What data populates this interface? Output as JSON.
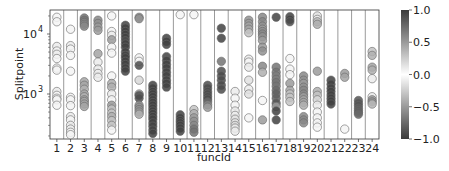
{
  "chart_data": {
    "type": "scatter",
    "title": "",
    "xlabel": "funcId",
    "ylabel": "Splitpoint",
    "yscale": "log",
    "ylim": [
      178,
      25000
    ],
    "y_ticks": [
      {
        "value": 1000,
        "label": "10^3",
        "base": "10",
        "exp": "3"
      },
      {
        "value": 10000,
        "label": "10^4",
        "base": "10",
        "exp": "4"
      }
    ],
    "categories": [
      "1",
      "2",
      "3",
      "4",
      "5",
      "6",
      "7",
      "8",
      "9",
      "10",
      "11",
      "12",
      "13",
      "14",
      "15",
      "16",
      "17",
      "18",
      "19",
      "20",
      "21",
      "22",
      "23",
      "24"
    ],
    "grid": "vertical separators between categories",
    "colorbar": {
      "min": -1.0,
      "max": 1.0,
      "ticks": [
        "1.0",
        "0.5",
        "0.0",
        "−0.5",
        "−1.0"
      ],
      "tick_values": [
        1.0,
        0.5,
        0.0,
        -0.5,
        -1.0
      ],
      "colormap": "diverging gray (dark at ±1, white at 0)"
    },
    "series": [
      {
        "funcId": "1",
        "points": [
          [
            19000,
            0.05
          ],
          [
            16000,
            0.05
          ],
          [
            6200,
            0.1
          ],
          [
            5200,
            0.05
          ],
          [
            4600,
            0.1
          ],
          [
            3900,
            0.05
          ],
          [
            2700,
            0.05
          ],
          [
            2500,
            0.05
          ],
          [
            1100,
            0.1
          ],
          [
            950,
            0.05
          ],
          [
            850,
            0.05
          ],
          [
            800,
            0.05
          ],
          [
            650,
            0.05
          ]
        ]
      },
      {
        "funcId": "2",
        "points": [
          [
            12000,
            0.05
          ],
          [
            6400,
            0.1
          ],
          [
            5600,
            0.05
          ],
          [
            4400,
            0.05
          ],
          [
            2400,
            0.05
          ],
          [
            880,
            0.05
          ],
          [
            800,
            0.05
          ],
          [
            640,
            0.05
          ],
          [
            420,
            0.1
          ],
          [
            370,
            0.05
          ],
          [
            300,
            0.1
          ],
          [
            260,
            0.1
          ],
          [
            230,
            0.05
          ],
          [
            210,
            0.05
          ]
        ]
      },
      {
        "funcId": "3",
        "points": [
          [
            18500,
            0.7
          ],
          [
            17000,
            0.7
          ],
          [
            15500,
            0.6
          ],
          [
            14500,
            0.6
          ],
          [
            13500,
            0.6
          ],
          [
            1600,
            0.45
          ],
          [
            1400,
            0.45
          ],
          [
            1200,
            0.4
          ],
          [
            1000,
            0.45
          ],
          [
            900,
            0.4
          ],
          [
            800,
            0.45
          ],
          [
            750,
            0.45
          ],
          [
            680,
            0.45
          ],
          [
            620,
            0.45
          ]
        ]
      },
      {
        "funcId": "4",
        "points": [
          [
            17000,
            0.6
          ],
          [
            15000,
            0.55
          ],
          [
            13000,
            0.5
          ],
          [
            11500,
            0.5
          ],
          [
            4700,
            0.45
          ],
          [
            3400,
            0.1
          ],
          [
            2600,
            0.1
          ],
          [
            2200,
            0.1
          ],
          [
            1900,
            0.1
          ]
        ]
      },
      {
        "funcId": "5",
        "points": [
          [
            20000,
            0.05
          ],
          [
            11000,
            0.05
          ],
          [
            9500,
            0.1
          ],
          [
            8000,
            0.5
          ],
          [
            6000,
            0.05
          ],
          [
            4800,
            0.05
          ],
          [
            2000,
            0.05
          ],
          [
            1500,
            0.4
          ],
          [
            1300,
            0.4
          ],
          [
            1000,
            0.1
          ],
          [
            800,
            0.05
          ],
          [
            650,
            0.5
          ],
          [
            560,
            0.3
          ],
          [
            480,
            0.3
          ],
          [
            420,
            0.4
          ],
          [
            360,
            0.3
          ],
          [
            300,
            0.3
          ],
          [
            250,
            0.05
          ]
        ]
      },
      {
        "funcId": "6",
        "points": [
          [
            14000,
            0.95
          ],
          [
            12500,
            0.95
          ],
          [
            11000,
            0.95
          ],
          [
            9800,
            0.95
          ],
          [
            8700,
            0.95
          ],
          [
            7700,
            0.9
          ],
          [
            6800,
            0.95
          ],
          [
            6000,
            0.95
          ],
          [
            5000,
            0.95
          ],
          [
            4400,
            0.95
          ],
          [
            4000,
            0.95
          ],
          [
            3500,
            0.95
          ],
          [
            3100,
            0.95
          ],
          [
            2700,
            0.95
          ],
          [
            2400,
            0.95
          ]
        ]
      },
      {
        "funcId": "7",
        "points": [
          [
            19000,
            0.55
          ],
          [
            18000,
            0.55
          ],
          [
            4000,
            0.05
          ],
          [
            3500,
            0.05
          ],
          [
            3000,
            0.9
          ],
          [
            1700,
            0.2
          ],
          [
            1000,
            0.4
          ],
          [
            950,
            0.9
          ],
          [
            850,
            0.9
          ],
          [
            650,
            0.55
          ],
          [
            600,
            0.55
          ],
          [
            550,
            0.55
          ],
          [
            500,
            0.5
          ],
          [
            460,
            0.4
          ]
        ]
      },
      {
        "funcId": "8",
        "points": [
          [
            1400,
            0.95
          ],
          [
            1250,
            0.95
          ],
          [
            1100,
            0.95
          ],
          [
            1000,
            0.95
          ],
          [
            900,
            0.95
          ],
          [
            800,
            0.95
          ],
          [
            720,
            0.95
          ],
          [
            650,
            0.95
          ],
          [
            580,
            0.95
          ],
          [
            520,
            0.95
          ],
          [
            470,
            0.95
          ],
          [
            420,
            0.95
          ],
          [
            380,
            0.95
          ],
          [
            330,
            0.95
          ],
          [
            290,
            0.95
          ],
          [
            250,
            0.95
          ],
          [
            220,
            0.95
          ]
        ]
      },
      {
        "funcId": "9",
        "points": [
          [
            8500,
            0.95
          ],
          [
            7500,
            0.95
          ],
          [
            6700,
            0.95
          ],
          [
            4200,
            0.95
          ],
          [
            3600,
            0.95
          ],
          [
            3100,
            0.95
          ],
          [
            2700,
            0.95
          ],
          [
            2300,
            0.95
          ],
          [
            2000,
            0.95
          ],
          [
            1700,
            0.95
          ],
          [
            1500,
            0.95
          ],
          [
            1300,
            0.95
          ]
        ]
      },
      {
        "funcId": "10",
        "points": [
          [
            21000,
            0.05
          ],
          [
            450,
            0.95
          ],
          [
            400,
            0.95
          ],
          [
            360,
            0.95
          ],
          [
            330,
            0.95
          ],
          [
            300,
            0.95
          ],
          [
            270,
            0.95
          ],
          [
            240,
            0.95
          ]
        ]
      },
      {
        "funcId": "11",
        "points": [
          [
            21000,
            0.05
          ],
          [
            550,
            0.3
          ],
          [
            470,
            0.4
          ],
          [
            400,
            0.5
          ],
          [
            350,
            0.55
          ],
          [
            300,
            0.6
          ],
          [
            260,
            0.7
          ],
          [
            230,
            0.7
          ]
        ]
      },
      {
        "funcId": "12",
        "points": [
          [
            1400,
            0.9
          ],
          [
            1250,
            0.9
          ],
          [
            1100,
            0.9
          ],
          [
            1000,
            0.9
          ],
          [
            900,
            0.9
          ],
          [
            820,
            0.9
          ],
          [
            740,
            0.75
          ],
          [
            660,
            0.6
          ],
          [
            600,
            0.5
          ]
        ]
      },
      {
        "funcId": "13",
        "points": [
          [
            12500,
            0.95
          ],
          [
            8500,
            0.95
          ],
          [
            3500,
            0.7
          ],
          [
            2400,
            0.9
          ],
          [
            2000,
            0.9
          ],
          [
            1700,
            0.9
          ],
          [
            1400,
            0.9
          ],
          [
            1200,
            0.9
          ]
        ]
      },
      {
        "funcId": "14",
        "points": [
          [
            1100,
            0.1
          ],
          [
            850,
            0.05
          ],
          [
            650,
            0.05
          ],
          [
            520,
            0.1
          ],
          [
            440,
            0.1
          ],
          [
            380,
            0.15
          ],
          [
            330,
            0.1
          ],
          [
            300,
            0.2
          ],
          [
            270,
            0.1
          ],
          [
            240,
            0.1
          ]
        ]
      },
      {
        "funcId": "15",
        "points": [
          [
            17000,
            0.55
          ],
          [
            15000,
            0.5
          ],
          [
            13500,
            0.45
          ],
          [
            12000,
            0.45
          ],
          [
            10500,
            0.3
          ],
          [
            3800,
            0.1
          ],
          [
            3400,
            0.05
          ],
          [
            2800,
            0.1
          ],
          [
            1700,
            0.15
          ],
          [
            1200,
            0.1
          ],
          [
            1000,
            0.15
          ],
          [
            400,
            0.05
          ]
        ]
      },
      {
        "funcId": "16",
        "points": [
          [
            19000,
            0.6
          ],
          [
            16000,
            0.6
          ],
          [
            13500,
            0.55
          ],
          [
            12000,
            0.5
          ],
          [
            11000,
            0.55
          ],
          [
            10000,
            0.6
          ],
          [
            9000,
            0.55
          ],
          [
            7800,
            0.5
          ],
          [
            6000,
            0.5
          ],
          [
            5200,
            0.55
          ],
          [
            2900,
            0.6
          ],
          [
            2300,
            0.4
          ],
          [
            780,
            0.05
          ],
          [
            370,
            0.5
          ]
        ]
      },
      {
        "funcId": "17",
        "points": [
          [
            19000,
            0.95
          ],
          [
            2800,
            0.7
          ],
          [
            2300,
            0.7
          ],
          [
            2000,
            0.65
          ],
          [
            1750,
            0.65
          ],
          [
            1550,
            0.7
          ],
          [
            1350,
            0.7
          ],
          [
            1150,
            0.75
          ],
          [
            1000,
            0.8
          ],
          [
            850,
            0.8
          ],
          [
            700,
            0.85
          ],
          [
            620,
            0.5
          ],
          [
            520,
            0.95
          ],
          [
            370,
            0.95
          ]
        ]
      },
      {
        "funcId": "18",
        "points": [
          [
            19500,
            0.95
          ],
          [
            17500,
            0.95
          ],
          [
            16000,
            0.9
          ],
          [
            3900,
            0.05
          ],
          [
            2600,
            0.05
          ],
          [
            2100,
            0.05
          ],
          [
            1500,
            0.5
          ],
          [
            1150,
            0.45
          ],
          [
            1000,
            0.3
          ],
          [
            880,
            0.3
          ],
          [
            750,
            0.3
          ]
        ]
      },
      {
        "funcId": "19",
        "points": [
          [
            2000,
            0.6
          ],
          [
            1700,
            0.55
          ],
          [
            1500,
            0.5
          ],
          [
            1300,
            0.55
          ],
          [
            1150,
            0.6
          ],
          [
            1000,
            0.6
          ],
          [
            900,
            0.5
          ],
          [
            800,
            0.45
          ],
          [
            720,
            0.45
          ],
          [
            650,
            0.4
          ],
          [
            420,
            0.6
          ],
          [
            370,
            0.6
          ],
          [
            330,
            0.6
          ]
        ]
      },
      {
        "funcId": "20",
        "points": [
          [
            20000,
            0.15
          ],
          [
            17500,
            0.1
          ],
          [
            16000,
            0.35
          ],
          [
            14500,
            0.4
          ],
          [
            2400,
            0.5
          ],
          [
            1100,
            0.4
          ],
          [
            950,
            0.3
          ],
          [
            800,
            0.2
          ],
          [
            650,
            0.1
          ],
          [
            500,
            0.05
          ],
          [
            400,
            0.05
          ],
          [
            330,
            0.05
          ],
          [
            280,
            0.05
          ]
        ]
      },
      {
        "funcId": "21",
        "points": [
          [
            1700,
            0.95
          ],
          [
            1450,
            0.95
          ],
          [
            1250,
            0.95
          ],
          [
            1100,
            0.95
          ],
          [
            960,
            0.95
          ],
          [
            850,
            0.95
          ],
          [
            760,
            0.95
          ],
          [
            680,
            0.95
          ]
        ]
      },
      {
        "funcId": "22",
        "points": [
          [
            2200,
            0.5
          ],
          [
            1900,
            0.45
          ],
          [
            260,
            0.05
          ]
        ]
      },
      {
        "funcId": "23",
        "points": [
          [
            780,
            0.85
          ],
          [
            700,
            0.85
          ],
          [
            640,
            0.85
          ],
          [
            580,
            0.8
          ],
          [
            530,
            0.8
          ],
          [
            490,
            0.8
          ],
          [
            460,
            0.75
          ]
        ]
      },
      {
        "funcId": "24",
        "points": [
          [
            5100,
            0.3
          ],
          [
            4400,
            0.4
          ],
          [
            2800,
            0.45
          ],
          [
            2500,
            0.4
          ],
          [
            1800,
            0.1
          ],
          [
            900,
            0.1
          ],
          [
            800,
            0.5
          ],
          [
            740,
            0.55
          ],
          [
            680,
            0.35
          ]
        ]
      }
    ]
  }
}
